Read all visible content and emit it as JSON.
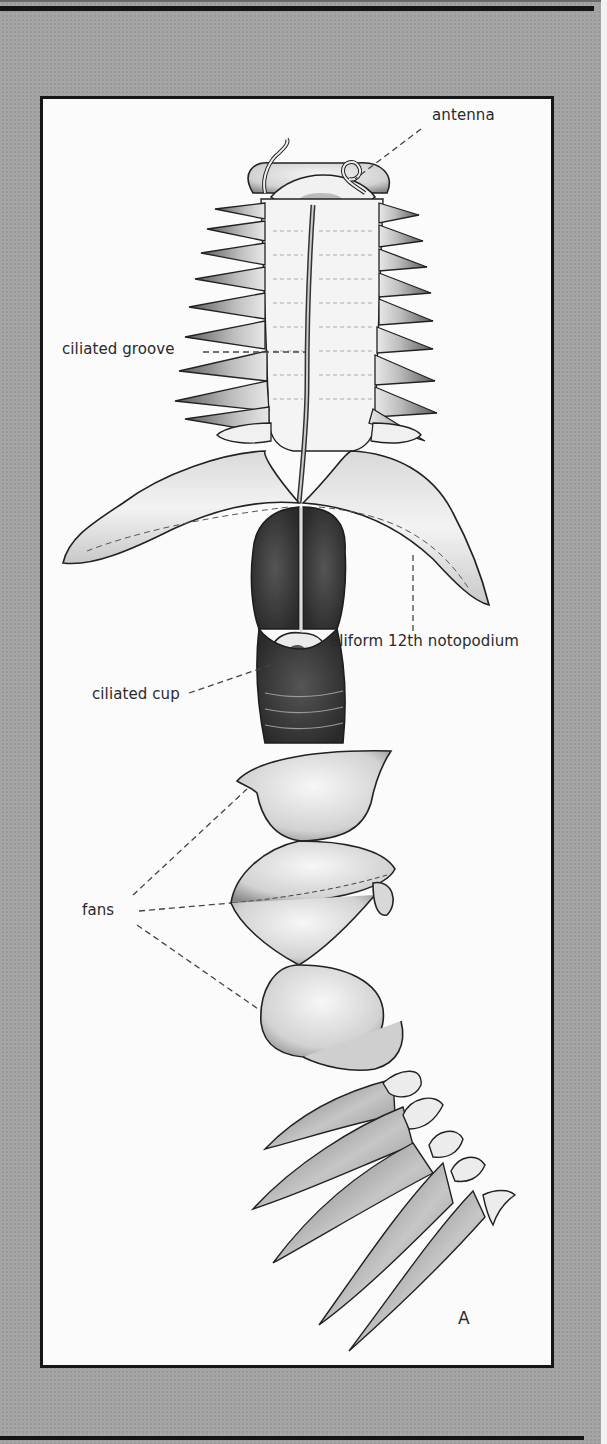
{
  "figure": {
    "panel_letter": "A",
    "labels": {
      "antenna": "antenna",
      "ciliated_groove": "ciliated groove",
      "aliform_notopodium": "aliform 12th notopodium",
      "ciliated_cup": "ciliated cup",
      "fans": "fans"
    }
  },
  "colors": {
    "panel_gray": "#a4a4a4",
    "frame_border": "#161616",
    "frame_fill": "#fbfbfb",
    "ink": "#2a2a2a"
  }
}
